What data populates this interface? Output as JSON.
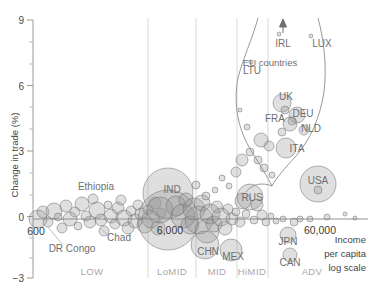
{
  "chart_data": {
    "type": "scatter",
    "title": "",
    "ylabel": "Change in trade (%)",
    "xlabel": "Income per capita log scale",
    "xlabel_lines": [
      "Income",
      "per capita",
      "log scale"
    ],
    "ylim": [
      -3,
      9
    ],
    "yticks": [
      9,
      6,
      3,
      0,
      -3
    ],
    "ytick_labels": [
      "9",
      "6",
      "3",
      "0",
      "−3"
    ],
    "xtick_labels": [
      "600",
      "6,000",
      "60,000"
    ],
    "xscale": "log",
    "grid": "vertical-only",
    "legend": "none",
    "bubble_size_meaning": "trade volume",
    "income_bands": [
      {
        "label": "LOW",
        "x": 92
      },
      {
        "label": "LoMID",
        "x": 172
      },
      {
        "label": "MID",
        "x": 217
      },
      {
        "label": "HiMID",
        "x": 252
      },
      {
        "label": "ADV",
        "x": 312
      }
    ],
    "annotations": [
      {
        "text": "EU countries",
        "x": 270,
        "y": 63
      },
      {
        "text": "Income",
        "x": 333,
        "y": 240
      },
      {
        "text": "per capita",
        "x": 333,
        "y": 255
      },
      {
        "text": "log scale",
        "x": 333,
        "y": 270
      }
    ],
    "labeled_points": [
      {
        "name": "IRL",
        "label_x": 283,
        "label_y": 43,
        "y_value": 9.5,
        "offscreen": true,
        "arrow": true
      },
      {
        "name": "LUX",
        "label_x": 322,
        "label_y": 44,
        "y_value": 8.6
      },
      {
        "name": "LTU",
        "label_x": 252,
        "label_y": 70,
        "y_value": 6.8
      },
      {
        "name": "UK",
        "label_x": 285,
        "label_y": 96,
        "y_value": 5.0
      },
      {
        "name": "DEU",
        "label_x": 300,
        "label_y": 113,
        "y_value": 4.4
      },
      {
        "name": "FRA",
        "label_x": 275,
        "label_y": 119,
        "y_value": 4.2
      },
      {
        "name": "NLD",
        "label_x": 308,
        "label_y": 128,
        "y_value": 3.8
      },
      {
        "name": "ITA",
        "label_x": 295,
        "label_y": 148,
        "y_value": 3.0
      },
      {
        "name": "USA",
        "label_x": 318,
        "label_y": 181,
        "y_value": 1.5
      },
      {
        "name": "RUS",
        "label_x": 250,
        "label_y": 198,
        "y_value": 0.8
      },
      {
        "name": "IND",
        "label_x": 172,
        "label_y": 190,
        "y_value": 1.2
      },
      {
        "name": "CHN",
        "label_x": 207,
        "label_y": 251,
        "y_value": -1.3
      },
      {
        "name": "MEX",
        "label_x": 232,
        "label_y": 257,
        "y_value": -1.5
      },
      {
        "name": "JPN",
        "label_x": 288,
        "label_y": 242,
        "y_value": -0.8
      },
      {
        "name": "CAN",
        "label_x": 290,
        "label_y": 263,
        "y_value": -1.6
      },
      {
        "name": "Ethiopia",
        "label_x": 96,
        "label_y": 187,
        "y_value": 1.3
      },
      {
        "name": "Chad",
        "label_x": 117,
        "label_y": 238,
        "y_value": -0.9
      },
      {
        "name": "DR Congo",
        "label_x": 70,
        "label_y": 249,
        "y_value": -1.1
      }
    ],
    "bubbles": [
      {
        "cx": 38,
        "cy": 219,
        "r": 9
      },
      {
        "cx": 43,
        "cy": 212,
        "r": 6
      },
      {
        "cx": 48,
        "cy": 222,
        "r": 5
      },
      {
        "cx": 54,
        "cy": 211,
        "r": 8
      },
      {
        "cx": 58,
        "cy": 217,
        "r": 4
      },
      {
        "cx": 62,
        "cy": 228,
        "r": 5
      },
      {
        "cx": 66,
        "cy": 206,
        "r": 6
      },
      {
        "cx": 70,
        "cy": 219,
        "r": 7
      },
      {
        "cx": 75,
        "cy": 212,
        "r": 5
      },
      {
        "cx": 78,
        "cy": 226,
        "r": 4
      },
      {
        "cx": 82,
        "cy": 204,
        "r": 7
      },
      {
        "cx": 86,
        "cy": 216,
        "r": 5
      },
      {
        "cx": 90,
        "cy": 222,
        "r": 6
      },
      {
        "cx": 93,
        "cy": 199,
        "r": 5
      },
      {
        "cx": 97,
        "cy": 210,
        "r": 8
      },
      {
        "cx": 101,
        "cy": 220,
        "r": 6
      },
      {
        "cx": 104,
        "cy": 231,
        "r": 5
      },
      {
        "cx": 108,
        "cy": 205,
        "r": 4
      },
      {
        "cx": 111,
        "cy": 216,
        "r": 7
      },
      {
        "cx": 115,
        "cy": 224,
        "r": 5
      },
      {
        "cx": 118,
        "cy": 208,
        "r": 6
      },
      {
        "cx": 121,
        "cy": 200,
        "r": 5
      },
      {
        "cx": 124,
        "cy": 218,
        "r": 8
      },
      {
        "cx": 128,
        "cy": 228,
        "r": 6
      },
      {
        "cx": 131,
        "cy": 211,
        "r": 5
      },
      {
        "cx": 135,
        "cy": 221,
        "r": 7
      },
      {
        "cx": 138,
        "cy": 205,
        "r": 5
      },
      {
        "cx": 141,
        "cy": 214,
        "r": 6
      },
      {
        "cx": 145,
        "cy": 225,
        "r": 8
      },
      {
        "cx": 148,
        "cy": 210,
        "r": 5
      },
      {
        "cx": 151,
        "cy": 219,
        "r": 9
      },
      {
        "cx": 155,
        "cy": 203,
        "r": 6
      },
      {
        "cx": 158,
        "cy": 228,
        "r": 7
      },
      {
        "cx": 161,
        "cy": 213,
        "r": 5
      },
      {
        "cx": 168,
        "cy": 193,
        "r": 25
      },
      {
        "cx": 168,
        "cy": 220,
        "r": 30
      },
      {
        "cx": 160,
        "cy": 210,
        "r": 13
      },
      {
        "cx": 176,
        "cy": 206,
        "r": 10
      },
      {
        "cx": 183,
        "cy": 216,
        "r": 12
      },
      {
        "cx": 190,
        "cy": 225,
        "r": 9
      },
      {
        "cx": 186,
        "cy": 200,
        "r": 7
      },
      {
        "cx": 194,
        "cy": 209,
        "r": 11
      },
      {
        "cx": 199,
        "cy": 220,
        "r": 14
      },
      {
        "cx": 202,
        "cy": 203,
        "r": 8
      },
      {
        "cx": 207,
        "cy": 231,
        "r": 12
      },
      {
        "cx": 210,
        "cy": 214,
        "r": 10
      },
      {
        "cx": 214,
        "cy": 224,
        "r": 8
      },
      {
        "cx": 217,
        "cy": 207,
        "r": 6
      },
      {
        "cx": 221,
        "cy": 217,
        "r": 9
      },
      {
        "cx": 225,
        "cy": 228,
        "r": 7
      },
      {
        "cx": 228,
        "cy": 209,
        "r": 5
      },
      {
        "cx": 232,
        "cy": 219,
        "r": 6
      },
      {
        "cx": 231,
        "cy": 250,
        "r": 11
      },
      {
        "cx": 205,
        "cy": 245,
        "r": 14
      },
      {
        "cx": 236,
        "cy": 212,
        "r": 4
      },
      {
        "cx": 240,
        "cy": 222,
        "r": 5
      },
      {
        "cx": 250,
        "cy": 197,
        "r": 13
      },
      {
        "cx": 243,
        "cy": 201,
        "r": 8
      },
      {
        "cx": 257,
        "cy": 205,
        "r": 6
      },
      {
        "cx": 262,
        "cy": 215,
        "r": 5
      },
      {
        "cx": 246,
        "cy": 214,
        "r": 4
      },
      {
        "cx": 254,
        "cy": 220,
        "r": 4
      },
      {
        "cx": 266,
        "cy": 222,
        "r": 4
      },
      {
        "cx": 271,
        "cy": 216,
        "r": 3
      },
      {
        "cx": 276,
        "cy": 221,
        "r": 3
      },
      {
        "cx": 283,
        "cy": 219,
        "r": 3
      },
      {
        "cx": 288,
        "cy": 235,
        "r": 8
      },
      {
        "cx": 290,
        "cy": 255,
        "r": 7
      },
      {
        "cx": 294,
        "cy": 222,
        "r": 4
      },
      {
        "cx": 300,
        "cy": 219,
        "r": 3
      },
      {
        "cx": 318,
        "cy": 184,
        "r": 18
      },
      {
        "cx": 318,
        "cy": 190,
        "r": 4
      },
      {
        "cx": 310,
        "cy": 219,
        "r": 3
      },
      {
        "cx": 327,
        "cy": 217,
        "r": 3
      },
      {
        "cx": 345,
        "cy": 214,
        "r": 2
      },
      {
        "cx": 355,
        "cy": 218,
        "r": 2
      },
      {
        "cx": 282,
        "cy": 103,
        "r": 9
      },
      {
        "cx": 285,
        "cy": 110,
        "r": 4
      },
      {
        "cx": 297,
        "cy": 115,
        "r": 8
      },
      {
        "cx": 292,
        "cy": 121,
        "r": 4
      },
      {
        "cx": 290,
        "cy": 124,
        "r": 7
      },
      {
        "cx": 304,
        "cy": 130,
        "r": 5
      },
      {
        "cx": 282,
        "cy": 132,
        "r": 4
      },
      {
        "cx": 286,
        "cy": 148,
        "r": 10
      },
      {
        "cx": 269,
        "cy": 146,
        "r": 5
      },
      {
        "cx": 261,
        "cy": 140,
        "r": 7
      },
      {
        "cx": 250,
        "cy": 152,
        "r": 4
      },
      {
        "cx": 242,
        "cy": 160,
        "r": 6
      },
      {
        "cx": 236,
        "cy": 172,
        "r": 5
      },
      {
        "cx": 247,
        "cy": 127,
        "r": 3
      },
      {
        "cx": 240,
        "cy": 110,
        "r": 2
      },
      {
        "cx": 258,
        "cy": 160,
        "r": 4
      },
      {
        "cx": 264,
        "cy": 168,
        "r": 4
      },
      {
        "cx": 272,
        "cy": 175,
        "r": 3
      },
      {
        "cx": 251,
        "cy": 62,
        "r": 2
      },
      {
        "cx": 311,
        "cy": 36,
        "r": 2
      },
      {
        "cx": 279,
        "cy": 34,
        "r": 2
      },
      {
        "cx": 229,
        "cy": 186,
        "r": 3
      },
      {
        "cx": 222,
        "cy": 178,
        "r": 3
      },
      {
        "cx": 215,
        "cy": 190,
        "r": 3
      },
      {
        "cx": 196,
        "cy": 185,
        "r": 4
      },
      {
        "cx": 206,
        "cy": 196,
        "r": 4
      }
    ]
  },
  "axis": {
    "y_title": "Change in trade (%)",
    "x_label_line1": "Income",
    "x_label_line2": "per capita",
    "x_label_line3": "log scale"
  }
}
